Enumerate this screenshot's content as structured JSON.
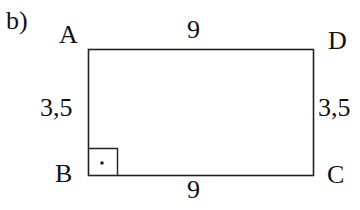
{
  "part_label": "b)",
  "vertices": {
    "A": "A",
    "B": "B",
    "C": "C",
    "D": "D"
  },
  "sides": {
    "top": "9",
    "bottom": "9",
    "left": "3,5",
    "right": "3,5"
  },
  "shape": {
    "type": "rectangle",
    "right_angle_at": "B",
    "stroke_color": "#222222"
  }
}
